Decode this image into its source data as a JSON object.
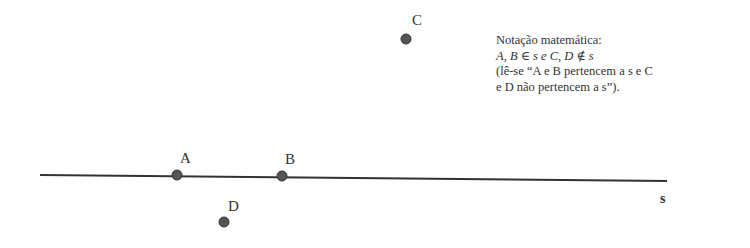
{
  "diagram": {
    "line": {
      "name": "s",
      "x1": 40,
      "y1": 175,
      "x2": 667,
      "y2": 181
    },
    "points": [
      {
        "name": "A",
        "cx": 177,
        "cy": 175,
        "label_x": 180,
        "label_y": 163,
        "on_line": true
      },
      {
        "name": "B",
        "cx": 282,
        "cy": 176,
        "label_x": 285,
        "label_y": 164,
        "on_line": true
      },
      {
        "name": "C",
        "cx": 406,
        "cy": 39,
        "label_x": 412,
        "label_y": 25,
        "on_line": false
      },
      {
        "name": "D",
        "cx": 224,
        "cy": 222,
        "label_x": 228,
        "label_y": 211,
        "on_line": false
      }
    ],
    "line_label": {
      "text": "s",
      "x": 660,
      "y": 203
    },
    "colors": {
      "stroke": "#333333",
      "point": "#555555"
    }
  },
  "note": {
    "title": "Notação matemática:",
    "line2": "A, B ∈ s e C, D ∉ s",
    "line3": "(lê-se “A e B pertencem a s e C",
    "line4": "e D não pertencem a s”)."
  }
}
